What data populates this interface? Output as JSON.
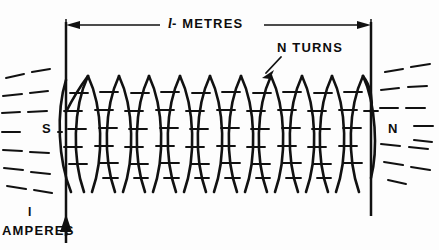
{
  "diagram": {
    "ink_color": "#111111",
    "background_color": "#fdfdfd"
  },
  "labels": {
    "length_symbol": "l",
    "length_text": "- METRES",
    "length_full": "l - METRES",
    "turns": "N TURNS",
    "pole_south": "S",
    "pole_north": "N",
    "current_symbol": "I",
    "current_units": "AMPERES"
  },
  "icons": {
    "dimension_arrow_left": "arrow-left-icon",
    "dimension_arrow_right": "arrow-right-icon",
    "current_arrow": "arrow-up-icon",
    "turns_pointer": "arrow-pointer-icon"
  },
  "geometry": {
    "canvas_width": 439,
    "canvas_height": 250,
    "dimension_line_y": 25,
    "dimension_x_start": 66,
    "dimension_x_end": 371,
    "extension_left_x": 66,
    "extension_right_x": 371,
    "extension_y_top": 19,
    "extension_y_bottom": 120,
    "coil_top_y": 75,
    "coil_bottom_y": 193,
    "turn_pitch": 30.6,
    "turn_half_width": 18,
    "turn_count_drawn": 10,
    "lead_left_x": 66,
    "lead_left_y_top": 19,
    "lead_left_y_bottom": 241,
    "lead_right_x": 371,
    "lead_right_y_top": 19,
    "lead_right_y_bottom": 216
  },
  "field_lines": {
    "description": "dashed magnetic flux lines emerging at both poles",
    "left_rows_y": [
      72,
      88,
      104,
      118,
      133,
      149,
      164,
      180
    ],
    "right_rows_y": [
      76,
      90,
      104,
      119,
      134,
      150,
      166,
      181
    ],
    "interior_tick_rows_y": [
      93,
      110,
      128,
      146,
      163,
      177
    ]
  }
}
